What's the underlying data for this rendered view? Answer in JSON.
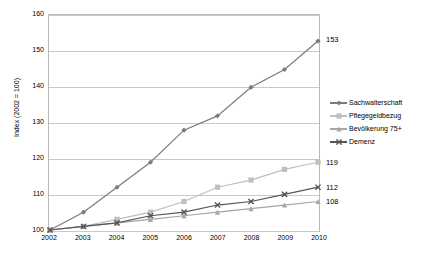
{
  "chart_data": {
    "type": "line",
    "title": "",
    "xlabel": "",
    "ylabel": "Index (2002 = 100)",
    "categories": [
      "2002",
      "2003",
      "2004",
      "2005",
      "2006",
      "2007",
      "2008",
      "2009",
      "2010"
    ],
    "x": [
      2002,
      2003,
      2004,
      2005,
      2006,
      2007,
      2008,
      2009,
      2010
    ],
    "ylim": [
      100,
      160
    ],
    "yticks": [
      100,
      110,
      120,
      130,
      140,
      150,
      160
    ],
    "ytick_labels": [
      "100",
      "110",
      "120",
      "130",
      "140",
      "150",
      "160"
    ],
    "grid": true,
    "legend_position": "right",
    "series": [
      {
        "name": "Sachwalterschaft",
        "color": "#7b7b7b",
        "marker": "diamond",
        "values": [
          100,
          105,
          112,
          119,
          128,
          132,
          140,
          145,
          153
        ],
        "end_label": "153"
      },
      {
        "name": "Pflegegeldbezug",
        "color": "#bfbfbf",
        "marker": "square",
        "values": [
          100,
          101,
          103,
          105,
          108,
          112,
          114,
          117,
          119
        ],
        "end_label": "119"
      },
      {
        "name": "Bevölkerung 75+",
        "color": "#a6a6a6",
        "marker": "triangle",
        "values": [
          100,
          101,
          102,
          103,
          104,
          105,
          106,
          107,
          108
        ],
        "end_label": "108"
      },
      {
        "name": "Demenz",
        "color": "#555555",
        "marker": "cross",
        "values": [
          100,
          101,
          102,
          104,
          105,
          107,
          108,
          110,
          112
        ],
        "end_label": "112"
      }
    ]
  },
  "legend": {
    "items": [
      {
        "label": "Sachwalterschaft"
      },
      {
        "label": "Pflegegeldbezug"
      },
      {
        "label": "Bevölkerung 75+"
      },
      {
        "label": "Demenz"
      }
    ]
  }
}
